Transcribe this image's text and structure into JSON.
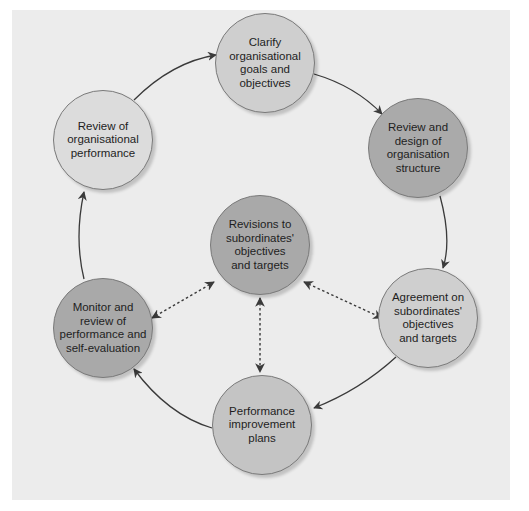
{
  "diagram": {
    "colors": {
      "background": "#ececec",
      "light_node": "#cfcfcf",
      "dark_node": "#a9a9a9",
      "arrow": "#3a3a3a"
    },
    "nodes": [
      {
        "id": "clarify",
        "label": "Clarify\norganisational\ngoals and\nobjectives",
        "shade": "light"
      },
      {
        "id": "review-design",
        "label": "Review and\ndesign of\norganisation\nstructure",
        "shade": "dark"
      },
      {
        "id": "agreement",
        "label": "Agreement on\nsubordinates'\nobjectives\nand targets",
        "shade": "light"
      },
      {
        "id": "performance-plans",
        "label": "Performance\nimprovement\nplans",
        "shade": "light"
      },
      {
        "id": "monitor",
        "label": "Monitor and\nreview of\nperformance and\nself-evaluation",
        "shade": "dark"
      },
      {
        "id": "review-org",
        "label": "Review of\norganisational\nperformance",
        "shade": "lighter"
      },
      {
        "id": "revisions",
        "label": "Revisions to\nsubordinates'\nobjectives\nand targets",
        "shade": "dark"
      }
    ],
    "edges": [
      {
        "from": "clarify",
        "to": "review-design",
        "style": "solid"
      },
      {
        "from": "review-design",
        "to": "agreement",
        "style": "solid"
      },
      {
        "from": "agreement",
        "to": "performance-plans",
        "style": "solid"
      },
      {
        "from": "performance-plans",
        "to": "monitor",
        "style": "solid"
      },
      {
        "from": "monitor",
        "to": "review-org",
        "style": "solid"
      },
      {
        "from": "review-org",
        "to": "clarify",
        "style": "solid"
      },
      {
        "from": "revisions",
        "to": "monitor",
        "style": "dashed-bidirectional"
      },
      {
        "from": "revisions",
        "to": "agreement",
        "style": "dashed-bidirectional"
      },
      {
        "from": "revisions",
        "to": "performance-plans",
        "style": "dashed-bidirectional"
      }
    ]
  }
}
